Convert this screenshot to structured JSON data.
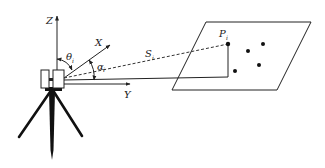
{
  "diagram": {
    "labels": {
      "z_axis": "Z",
      "x_axis": "X",
      "y_axis": "Y",
      "theta": "θ",
      "theta_sub": "i",
      "alpha": "α",
      "alpha_sub": "i",
      "range": "S",
      "range_sub": "i",
      "point": "P",
      "point_sub": "i"
    },
    "colors": {
      "stroke": "#222222",
      "background": "#ffffff"
    },
    "scan_points": [
      {
        "x": 248,
        "y": 51
      },
      {
        "x": 263,
        "y": 44
      },
      {
        "x": 259,
        "y": 65
      },
      {
        "x": 235,
        "y": 71
      }
    ]
  }
}
